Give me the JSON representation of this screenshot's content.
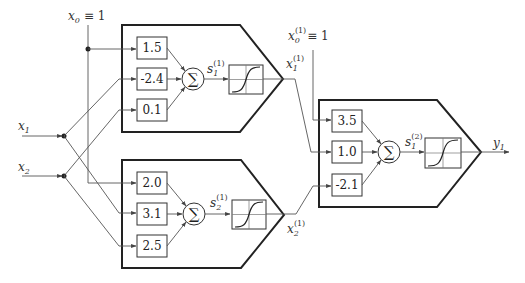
{
  "inputs": {
    "x0": {
      "symbol": "x",
      "sub": "0",
      "equiv": "≡ 1"
    },
    "x1": {
      "symbol": "x",
      "sub": "1"
    },
    "x2": {
      "symbol": "x",
      "sub": "2"
    }
  },
  "hidden_layer": {
    "neurons": [
      {
        "name": "hidden-neuron-1",
        "weights": [
          "1.5",
          "-2.4",
          "0.1"
        ],
        "sum_symbol": "∑",
        "pre_activation": {
          "symbol": "s",
          "sub": "1",
          "sup": "(1)"
        },
        "output": {
          "symbol": "x",
          "sub": "1",
          "sup": "(1)"
        }
      },
      {
        "name": "hidden-neuron-2",
        "weights": [
          "2.0",
          "3.1",
          "2.5"
        ],
        "sum_symbol": "∑",
        "pre_activation": {
          "symbol": "s",
          "sub": "2",
          "sup": "(1)"
        },
        "output": {
          "symbol": "x",
          "sub": "2",
          "sup": "(1)"
        }
      }
    ],
    "bias": {
      "symbol": "x",
      "sub": "0",
      "sup": "(1)",
      "equiv": "≡ 1"
    }
  },
  "output_layer": {
    "neurons": [
      {
        "name": "output-neuron-1",
        "weights": [
          "3.5",
          "1.0",
          "-2.1"
        ],
        "sum_symbol": "∑",
        "pre_activation": {
          "symbol": "s",
          "sub": "1",
          "sup": "(2)"
        },
        "output": {
          "symbol": "y",
          "sub": "1"
        }
      }
    ]
  },
  "activation": "sigmoid"
}
